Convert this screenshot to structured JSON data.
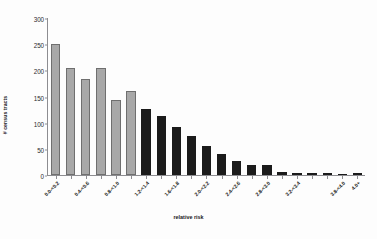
{
  "chart_data": {
    "type": "bar",
    "title": "",
    "xlabel": "relative risk",
    "ylabel": "# census tracts",
    "ylim": [
      0,
      300
    ],
    "yticks": [
      0,
      50,
      100,
      150,
      200,
      250,
      300
    ],
    "grid": false,
    "legend": null,
    "categories": [
      "0.0-<0.2",
      "0.2-<0.4",
      "0.4-<0.6",
      "0.6-<0.8",
      "0.8-<1.0",
      "1.0-<1.2",
      "1.2-<1.4",
      "1.4-<1.6",
      "1.6-<1.8",
      "1.8-<2.0",
      "2.0-<2.2",
      "2.2-<2.4",
      "2.4-<2.6",
      "2.6-<2.8",
      "2.8-<3.0",
      "3.0-<3.2",
      "3.2-<3.4",
      "3.4-<3.6",
      "3.6-<3.8",
      "3.8-<4.0",
      "4.0+"
    ],
    "tick_labels_shown": [
      "0.0-<0.2",
      "0.4-<0.6",
      "0.8-<1.0",
      "1.2-<1.4",
      "1.6-<1.8",
      "2.0-<2.2",
      "2.4-<2.6",
      "2.8-<3.0",
      "3.2-<3.4",
      "3.8-<4.0",
      "4.0+"
    ],
    "values": [
      251,
      204,
      183,
      204,
      144,
      161,
      127,
      112,
      92,
      75,
      55,
      40,
      26,
      20,
      20,
      6,
      4,
      3,
      3,
      2,
      3
    ],
    "bar_colors": [
      "#a8a8a8",
      "#a8a8a8",
      "#a8a8a8",
      "#a8a8a8",
      "#a8a8a8",
      "#a8a8a8",
      "#1b1b1b",
      "#1b1b1b",
      "#1b1b1b",
      "#1b1b1b",
      "#1b1b1b",
      "#1b1b1b",
      "#1b1b1b",
      "#1b1b1b",
      "#1b1b1b",
      "#1b1b1b",
      "#1b1b1b",
      "#1b1b1b",
      "#1b1b1b",
      "#1b1b1b",
      "#1b1b1b"
    ],
    "colors": {
      "light_bar": "#a8a8a8",
      "light_bar_edge": "#6f6f6f",
      "dark_bar": "#1b1b1b",
      "axis": "#8d8d91",
      "text": "#17171a",
      "background": "#fdfdfd"
    }
  }
}
